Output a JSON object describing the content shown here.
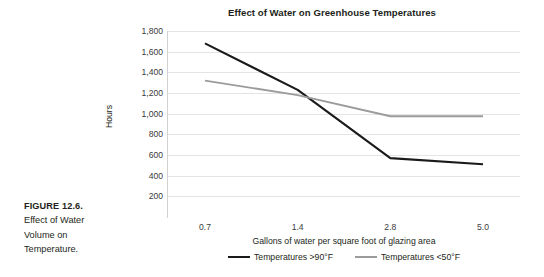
{
  "caption": {
    "figure_label": "FIGURE 12.6.",
    "figure_text": "Effect of Water Volume on Temperature."
  },
  "chart_data": {
    "type": "line",
    "title": "Effect of Water on Greenhouse Temperatures",
    "xlabel": "Gallons of water per square foot of glazing area",
    "ylabel": "Hours",
    "categories": [
      "0.7",
      "1.4",
      "2.8",
      "5.0"
    ],
    "ylim": [
      0,
      1800
    ],
    "yticks": [
      200,
      400,
      600,
      800,
      1000,
      1200,
      1400,
      1600,
      1800
    ],
    "ytick_labels": [
      "200",
      "400",
      "600",
      "800",
      "1,000",
      "1,200",
      "1,400",
      "1,600",
      "1,800"
    ],
    "grid": true,
    "legend_position": "bottom",
    "series": [
      {
        "name": "Temperatures >90°F",
        "color": "#1a1a1a",
        "values": [
          1680,
          1230,
          570,
          510
        ]
      },
      {
        "name": "Temperatures <50°F",
        "color": "#9b9b9b",
        "values": [
          1320,
          1180,
          975,
          975
        ]
      }
    ]
  }
}
